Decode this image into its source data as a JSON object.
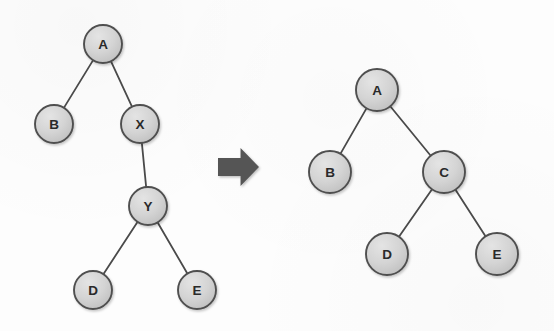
{
  "figure": {
    "name": "binary-tree-node-replacement-diagram",
    "background_color": "#fdfdfd",
    "node_fill_color": "#d2d2d2",
    "node_stroke_color": "#4f4f4f",
    "edge_color": "#4a4a4a",
    "label_color": "#2a2a2a",
    "arrow_color": "#555555"
  },
  "arrow": {
    "name": "right-arrow",
    "direction": "right",
    "color": "#555555",
    "x": 218,
    "y": 148,
    "width": 41,
    "height": 38
  },
  "left_tree": {
    "name": "before-tree",
    "nodes": [
      {
        "id": "L-A",
        "label": "A",
        "cx": 103,
        "cy": 44,
        "r": 19
      },
      {
        "id": "L-B",
        "label": "B",
        "cx": 54,
        "cy": 124,
        "r": 19
      },
      {
        "id": "L-X",
        "label": "X",
        "cx": 140,
        "cy": 124,
        "r": 19
      },
      {
        "id": "L-Y",
        "label": "Y",
        "cx": 148,
        "cy": 206,
        "r": 19
      },
      {
        "id": "L-D",
        "label": "D",
        "cx": 93,
        "cy": 290,
        "r": 19
      },
      {
        "id": "L-E",
        "label": "E",
        "cx": 197,
        "cy": 290,
        "r": 19
      }
    ],
    "edges": [
      {
        "from": "L-A",
        "to": "L-B"
      },
      {
        "from": "L-A",
        "to": "L-X"
      },
      {
        "from": "L-X",
        "to": "L-Y"
      },
      {
        "from": "L-Y",
        "to": "L-D"
      },
      {
        "from": "L-Y",
        "to": "L-E"
      }
    ]
  },
  "right_tree": {
    "name": "after-tree",
    "nodes": [
      {
        "id": "R-A",
        "label": "A",
        "cx": 377,
        "cy": 90,
        "r": 21
      },
      {
        "id": "R-B",
        "label": "B",
        "cx": 330,
        "cy": 172,
        "r": 21
      },
      {
        "id": "R-C",
        "label": "C",
        "cx": 444,
        "cy": 172,
        "r": 21
      },
      {
        "id": "R-D",
        "label": "D",
        "cx": 387,
        "cy": 254,
        "r": 21
      },
      {
        "id": "R-E",
        "label": "E",
        "cx": 497,
        "cy": 254,
        "r": 21
      }
    ],
    "edges": [
      {
        "from": "R-A",
        "to": "R-B"
      },
      {
        "from": "R-A",
        "to": "R-C"
      },
      {
        "from": "R-C",
        "to": "R-D"
      },
      {
        "from": "R-C",
        "to": "R-E"
      }
    ]
  }
}
